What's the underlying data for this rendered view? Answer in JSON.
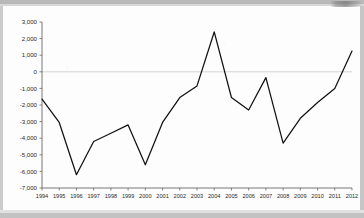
{
  "page": {
    "background_color": "#fdfdfd",
    "border_color": "#c2c2c2",
    "corner_artifact_name": "scan-artifact-top-right"
  },
  "chart_data": {
    "type": "line",
    "title": "",
    "subtitle": "",
    "xlabel": "",
    "ylabel": "",
    "categories": [
      "1994",
      "1995",
      "1996",
      "1997",
      "1998",
      "1999",
      "2000",
      "2001",
      "2002",
      "2003",
      "2004",
      "2005",
      "2006",
      "2007",
      "2008",
      "2009",
      "2010",
      "2011",
      "2012"
    ],
    "values": [
      -1650,
      -3050,
      -6200,
      -4200,
      -3700,
      -3200,
      -5600,
      -3050,
      -1550,
      -850,
      2400,
      -1550,
      -2300,
      -350,
      -4300,
      -2800,
      -1850,
      -1000,
      1250
    ],
    "series": [
      {
        "name": "",
        "color": "#111111",
        "values": [
          -1650,
          -3050,
          -6200,
          -4200,
          -3700,
          -3200,
          -5600,
          -3050,
          -1550,
          -850,
          2400,
          -1550,
          -2300,
          -350,
          -4300,
          -2800,
          -1850,
          -1000,
          1250
        ]
      }
    ],
    "ylim": [
      -7000,
      3000
    ],
    "ytick_step": 1000,
    "ytick_labels": [
      "3,000",
      "2,000",
      "1,000",
      "0",
      "-1,000",
      "-2,000",
      "-3,000",
      "-4,000",
      "-5,000",
      "-6,000",
      "-7,000"
    ],
    "ytick_values": [
      3000,
      2000,
      1000,
      0,
      -1000,
      -2000,
      -3000,
      -4000,
      -5000,
      -6000,
      -7000
    ],
    "grid": false,
    "zero_line": true,
    "zero_line_color": "#c9c9c9",
    "legend": false,
    "legend_position": "none",
    "axis_color": "#555555",
    "marker": "none"
  }
}
